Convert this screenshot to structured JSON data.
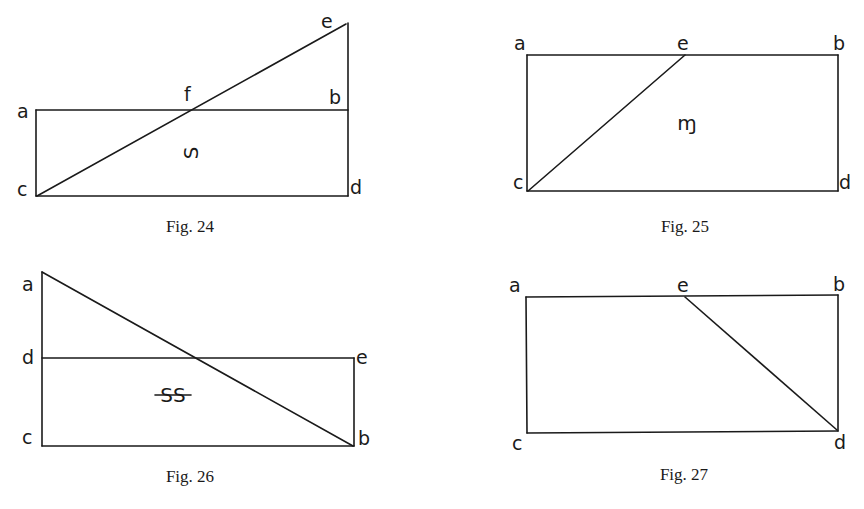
{
  "figures": [
    {
      "caption": "Fig. 24",
      "vertices": {
        "a": "a",
        "b": "b",
        "c": "c",
        "d": "d",
        "e": "e",
        "f": "f"
      },
      "region_label": "S (rotated)",
      "region_glyph": "S",
      "edges": [
        "a-b",
        "c-d",
        "a-c",
        "e-d",
        "c-e"
      ]
    },
    {
      "caption": "Fig. 25",
      "vertices": {
        "a": "a",
        "b": "b",
        "c": "c",
        "d": "d",
        "e": "e"
      },
      "region_label": "m (symbol)",
      "region_glyph": "ɱ",
      "edges": [
        "a-b",
        "c-d",
        "a-c",
        "b-d",
        "c-e"
      ]
    },
    {
      "caption": "Fig. 26",
      "vertices": {
        "a": "a",
        "b": "b",
        "c": "c",
        "d": "d",
        "e": "e"
      },
      "region_label": "SS (struck through)",
      "region_glyph": "SS",
      "edges": [
        "d-e",
        "c-b",
        "a-c",
        "e-b",
        "a-b"
      ]
    },
    {
      "caption": "Fig. 27",
      "vertices": {
        "a": "a",
        "b": "b",
        "c": "c",
        "d": "d",
        "e": "e"
      },
      "region_label": "",
      "region_glyph": "",
      "edges": [
        "a-b",
        "c-d",
        "a-c",
        "b-d",
        "e-d"
      ]
    }
  ]
}
